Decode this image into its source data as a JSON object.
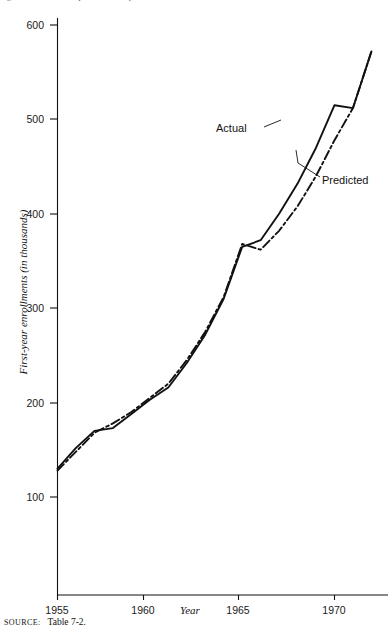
{
  "figure": {
    "caption_clipped": "Figure 7-1.  Actual and predicted first-year enrollments, 1955-1972",
    "source_key": "Source:",
    "source_value": "Table 7-2."
  },
  "chart_data": {
    "type": "line",
    "title": "",
    "xlabel": "Year",
    "ylabel": "First-year enrollments (in thousands)",
    "xlim": [
      1955,
      1972
    ],
    "ylim": [
      60,
      620
    ],
    "xticks": [
      1955,
      1960,
      1965,
      1970
    ],
    "xtick_labels": [
      "1955",
      "1960",
      "1965",
      "1970"
    ],
    "yticks": [
      100,
      200,
      300,
      400,
      500,
      600
    ],
    "ytick_labels": [
      "100",
      "200",
      "300",
      "400",
      "500",
      "600"
    ],
    "grid": false,
    "legend_position": "inline-annotation",
    "x": [
      1955,
      1956,
      1957,
      1958,
      1959,
      1960,
      1961,
      1962,
      1963,
      1964,
      1965,
      1966,
      1967,
      1968,
      1969,
      1970,
      1971,
      1972
    ],
    "series": [
      {
        "name": "Actual",
        "style": "solid",
        "color": "#111111",
        "values": [
          130,
          152,
          170,
          173,
          188,
          203,
          216,
          242,
          272,
          310,
          365,
          372,
          400,
          432,
          470,
          515,
          512,
          572
        ]
      },
      {
        "name": "Predicted",
        "style": "dash-dot",
        "color": "#111111",
        "values": [
          128,
          148,
          168,
          178,
          190,
          205,
          220,
          245,
          275,
          312,
          368,
          362,
          382,
          408,
          440,
          478,
          512,
          572
        ]
      }
    ],
    "annotations": [
      {
        "text": "Actual",
        "x": 1966.2,
        "y": 452
      },
      {
        "text": "Predicted",
        "x": 1971.0,
        "y": 400
      }
    ]
  }
}
